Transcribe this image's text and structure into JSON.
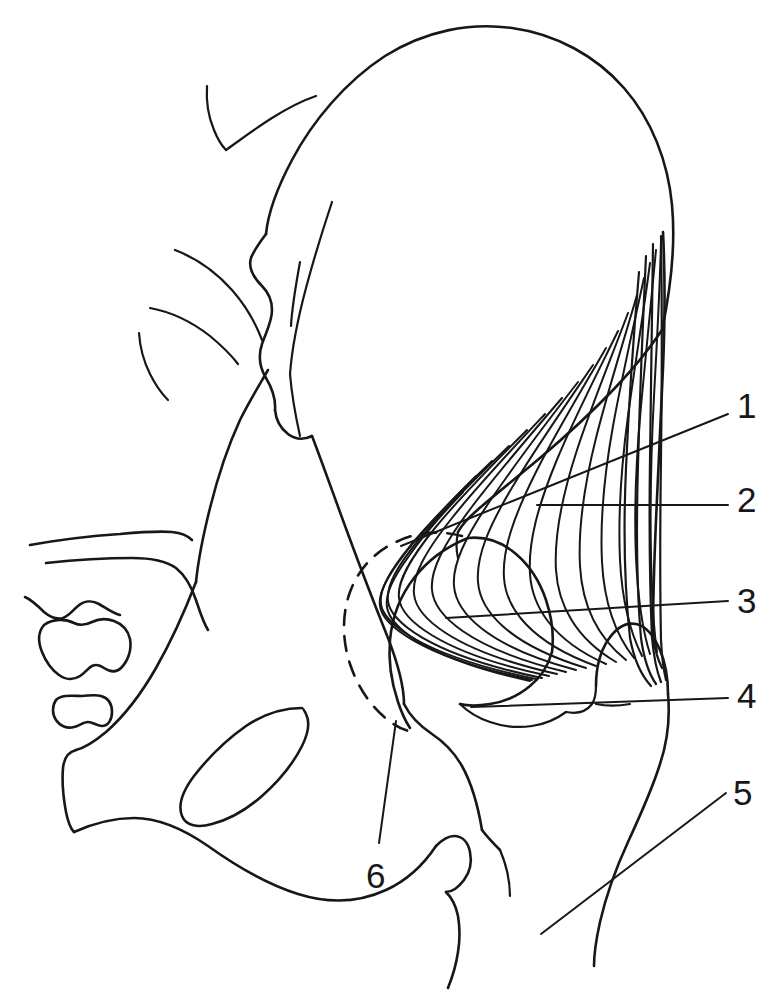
{
  "figure": {
    "type": "anatomical-line-drawing",
    "background_color": "#ffffff",
    "line_color": "#17171a",
    "width": 781,
    "height": 998
  },
  "labels": [
    {
      "id": "label-1",
      "text": "1",
      "x": 737,
      "y": 388,
      "leader": {
        "x1": 401,
        "y1": 546,
        "x2": 728,
        "y2": 414
      }
    },
    {
      "id": "label-2",
      "text": "2",
      "x": 737,
      "y": 482,
      "leader": {
        "x1": 537,
        "y1": 505,
        "x2": 728,
        "y2": 505
      }
    },
    {
      "id": "label-3",
      "text": "3",
      "x": 737,
      "y": 583,
      "leader": {
        "x1": 446,
        "y1": 618,
        "x2": 728,
        "y2": 601
      }
    },
    {
      "id": "label-4",
      "text": "4",
      "x": 737,
      "y": 678,
      "leader": {
        "x1": 471,
        "y1": 707,
        "x2": 728,
        "y2": 698
      }
    },
    {
      "id": "label-5",
      "text": "5",
      "x": 733,
      "y": 775,
      "leader": {
        "x1": 541,
        "y1": 934,
        "x2": 726,
        "y2": 793
      }
    },
    {
      "id": "label-6",
      "text": "6",
      "x": 366,
      "y": 858,
      "leader": {
        "x1": 396,
        "y1": 721,
        "x2": 379,
        "y2": 843
      }
    }
  ],
  "structures": {
    "ilium_crest": "iliac-crest-outline",
    "gluteal_muscle": "gluteus-medius-fibers",
    "gluteal_tendon": "gluteal-tendon-bundle",
    "femoral_head": "femoral-head-outline",
    "greater_trochanter": "greater-trochanter-outline",
    "lesser_trochanter": "lesser-trochanter-outline",
    "femoral_shaft": "femoral-shaft-outline",
    "acetabulum": "acetabulum-dashed-outline",
    "obturator_foramen": "obturator-foramen-outline",
    "sacrum": "sacrum-outline",
    "coccyx_segments": "coccyx-segments-outline",
    "ischial_ramus": "ischial-ramus-outline"
  },
  "muscle_fibers": {
    "radiating_count": 17,
    "description": "Fan-shaped muscle fibers radiating from the iliac crest and converging onto the greater trochanter tendon"
  }
}
